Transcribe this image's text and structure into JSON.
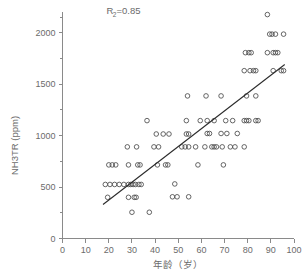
{
  "chart_data": {
    "type": "scatter",
    "title": "",
    "xlabel": "年龄（岁）",
    "ylabel": "NH3TR (ppm)",
    "xlim": [
      0,
      100
    ],
    "ylim": [
      0,
      2200
    ],
    "xticks": [
      0,
      10,
      20,
      30,
      40,
      50,
      60,
      70,
      80,
      90,
      100
    ],
    "xtick_labels": [
      "0",
      "10",
      "20",
      "30",
      "40",
      "50",
      "60",
      "70",
      "80",
      "90",
      "100"
    ],
    "yticks": [
      0,
      500,
      1000,
      1500,
      2000
    ],
    "ytick_labels": [
      "0",
      "500",
      "1000",
      "1500",
      "2000"
    ],
    "y_minor_ticks": [
      250,
      750,
      1250,
      1750,
      2150
    ],
    "grid": false,
    "legend": null,
    "marker_style": "open-circle",
    "marker_color": "#4a4a4a",
    "annotations": [
      {
        "name": "correlation-annotation",
        "text_main": "R",
        "text_sub": "2",
        "text_tail": "=0.85",
        "full_text": "R2=0.85",
        "x": 19,
        "y": 2180
      }
    ],
    "fit_line": {
      "name": "regression-line",
      "x_start": 17.5,
      "y_start": 330,
      "x_end": 96.0,
      "y_end": 1690,
      "color": "#2b2b2b"
    },
    "points": [
      [
        19.5,
        400
      ],
      [
        18.5,
        525
      ],
      [
        20.5,
        525
      ],
      [
        22.5,
        525
      ],
      [
        24.5,
        525
      ],
      [
        26.5,
        525
      ],
      [
        20.0,
        715
      ],
      [
        21.5,
        715
      ],
      [
        23.0,
        715
      ],
      [
        28.5,
        400
      ],
      [
        31.0,
        400
      ],
      [
        31.8,
        400
      ],
      [
        30.0,
        255
      ],
      [
        28.5,
        525
      ],
      [
        29.5,
        525
      ],
      [
        30.5,
        525
      ],
      [
        31.5,
        525
      ],
      [
        33.0,
        525
      ],
      [
        34.0,
        525
      ],
      [
        28.5,
        715
      ],
      [
        32.5,
        715
      ],
      [
        33.5,
        715
      ],
      [
        28.0,
        890
      ],
      [
        32.0,
        890
      ],
      [
        36.5,
        1145
      ],
      [
        37.5,
        255
      ],
      [
        39.5,
        890
      ],
      [
        41.5,
        890
      ],
      [
        40.5,
        1015
      ],
      [
        43.5,
        1015
      ],
      [
        46.0,
        1015
      ],
      [
        41.0,
        715
      ],
      [
        44.5,
        715
      ],
      [
        45.5,
        715
      ],
      [
        47.5,
        405
      ],
      [
        49.5,
        405
      ],
      [
        48.5,
        530
      ],
      [
        51.5,
        890
      ],
      [
        53.0,
        890
      ],
      [
        54.5,
        890
      ],
      [
        53.5,
        1015
      ],
      [
        54.5,
        1015
      ],
      [
        53.5,
        1145
      ],
      [
        54.0,
        1385
      ],
      [
        54.5,
        405
      ],
      [
        58.5,
        715
      ],
      [
        57.5,
        890
      ],
      [
        59.5,
        1145
      ],
      [
        62.5,
        1020
      ],
      [
        63.5,
        1020
      ],
      [
        62.0,
        1385
      ],
      [
        61.5,
        890
      ],
      [
        64.5,
        890
      ],
      [
        65.5,
        890
      ],
      [
        66.5,
        890
      ],
      [
        62.5,
        1145
      ],
      [
        65.5,
        1145
      ],
      [
        68.5,
        1385
      ],
      [
        69.5,
        715
      ],
      [
        68.5,
        1020
      ],
      [
        71.0,
        1020
      ],
      [
        69.0,
        890
      ],
      [
        72.5,
        890
      ],
      [
        74.5,
        890
      ],
      [
        70.5,
        1145
      ],
      [
        73.5,
        1145
      ],
      [
        75.5,
        1020
      ],
      [
        78.5,
        890
      ],
      [
        78.5,
        1145
      ],
      [
        79.5,
        1145
      ],
      [
        80.5,
        1145
      ],
      [
        83.5,
        1145
      ],
      [
        78.5,
        1630
      ],
      [
        81.0,
        1630
      ],
      [
        82.5,
        1630
      ],
      [
        83.5,
        1630
      ],
      [
        79.0,
        1805
      ],
      [
        80.5,
        1805
      ],
      [
        81.5,
        1805
      ],
      [
        79.5,
        1385
      ],
      [
        83.5,
        1385
      ],
      [
        88.5,
        2175
      ],
      [
        89.5,
        1985
      ],
      [
        90.5,
        1985
      ],
      [
        92.0,
        1985
      ],
      [
        95.5,
        1985
      ],
      [
        88.5,
        1805
      ],
      [
        91.0,
        1805
      ],
      [
        92.0,
        1805
      ],
      [
        93.0,
        1805
      ],
      [
        91.0,
        1630
      ],
      [
        94.5,
        1630
      ],
      [
        95.5,
        1630
      ],
      [
        84.5,
        1145
      ]
    ]
  },
  "figure": {
    "background_color": "#ffffff",
    "axis_color": "#8a8a8a",
    "text_color": "#6b6b6b"
  }
}
